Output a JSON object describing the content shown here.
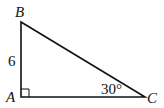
{
  "diagram": {
    "type": "right-triangle",
    "vertices": {
      "A": {
        "label": "A",
        "x": 21,
        "y": 97
      },
      "B": {
        "label": "B",
        "x": 21,
        "y": 22
      },
      "C": {
        "label": "C",
        "x": 145,
        "y": 97
      }
    },
    "side_labels": {
      "AB": "6"
    },
    "angle_labels": {
      "C": "30°"
    },
    "right_angle_at": "A",
    "stroke_color": "#111111",
    "background": "#ffffff"
  }
}
